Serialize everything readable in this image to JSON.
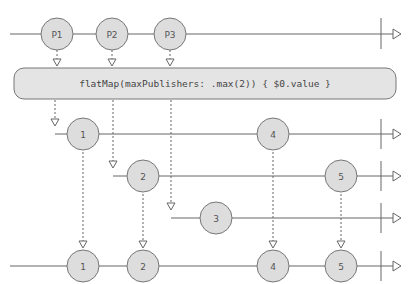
{
  "diagram": {
    "type": "marble-diagram",
    "colors": {
      "line": "#666666",
      "marble_fill": "#dddddd",
      "marble_stroke": "#777777",
      "operator_fill": "#e4e4e4",
      "text": "#555555"
    },
    "input": {
      "marbles": [
        {
          "label": "P1",
          "x": 57
        },
        {
          "label": "P2",
          "x": 112
        },
        {
          "label": "P3",
          "x": 170
        }
      ]
    },
    "operator": {
      "label": "flatMap(maxPublishers: .max(2)) { $0.value }"
    },
    "inner_streams": [
      {
        "start_x": 55,
        "marbles": [
          {
            "label": "1",
            "x": 83
          },
          {
            "label": "4",
            "x": 273
          }
        ]
      },
      {
        "start_x": 113,
        "marbles": [
          {
            "label": "2",
            "x": 143
          },
          {
            "label": "5",
            "x": 341
          }
        ]
      },
      {
        "start_x": 171,
        "marbles": [
          {
            "label": "3",
            "x": 216
          }
        ]
      }
    ],
    "output": {
      "marbles": [
        {
          "label": "1",
          "x": 83
        },
        {
          "label": "2",
          "x": 143
        },
        {
          "label": "4",
          "x": 273
        },
        {
          "label": "5",
          "x": 341
        }
      ]
    }
  }
}
